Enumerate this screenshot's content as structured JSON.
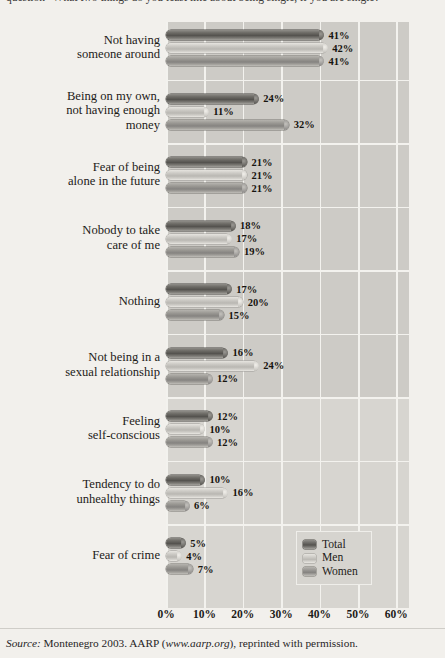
{
  "caption": "question \"What two things do you least like about being single, if you are single?\"",
  "source": {
    "prefix": "Source:",
    "text": " Montenegro 2003. AARP (",
    "url": "www.aarp.org",
    "suffix": "), reprinted with permission."
  },
  "legend": {
    "items": [
      {
        "label": "Total",
        "key": "total",
        "color": "#55534f"
      },
      {
        "label": "Men",
        "key": "men",
        "color": "#cdcbc6"
      },
      {
        "label": "Women",
        "key": "women",
        "color": "#9b9994"
      }
    ]
  },
  "axis": {
    "ticks": [
      "0%",
      "10%",
      "20%",
      "30%",
      "40%",
      "50%",
      "60%"
    ],
    "min": 0,
    "max": 60,
    "step": 10
  },
  "chart_data": {
    "type": "bar",
    "orientation": "horizontal",
    "title": "",
    "xlabel": "",
    "ylabel": "",
    "xlim": [
      0,
      60
    ],
    "grid": true,
    "legend_position": "bottom-right",
    "categories": [
      "Not having someone around",
      "Being on my own, not having enough money",
      "Fear of being alone in the future",
      "Nobody to take care of me",
      "Nothing",
      "Not being in a sexual relationship",
      "Feeling self-conscious",
      "Tendency to do unhealthy things",
      "Fear of crime"
    ],
    "category_lines": [
      [
        "Not having",
        "someone around"
      ],
      [
        "Being on my own,",
        "not having enough",
        "money"
      ],
      [
        "Fear of being",
        "alone in the future"
      ],
      [
        "Nobody to take",
        "care of me"
      ],
      [
        "Nothing"
      ],
      [
        "Not being in a",
        "sexual relationship"
      ],
      [
        "Feeling",
        "self-conscious"
      ],
      [
        "Tendency to do",
        "unhealthy things"
      ],
      [
        "Fear of crime"
      ]
    ],
    "series": [
      {
        "name": "Total",
        "key": "total",
        "values": [
          41,
          24,
          21,
          18,
          17,
          16,
          12,
          10,
          5
        ]
      },
      {
        "name": "Men",
        "key": "men",
        "values": [
          42,
          11,
          21,
          17,
          20,
          24,
          10,
          16,
          4
        ]
      },
      {
        "name": "Women",
        "key": "women",
        "values": [
          41,
          32,
          21,
          19,
          15,
          12,
          12,
          6,
          7
        ]
      }
    ],
    "labels": {
      "total": [
        "41%",
        "24%",
        "21%",
        "18%",
        "17%",
        "16%",
        "12%",
        "10%",
        "5%"
      ],
      "men": [
        "42%",
        "11%",
        "21%",
        "17%",
        "20%",
        "24%",
        "10%",
        "16%",
        "4%"
      ],
      "women": [
        "41%",
        "32%",
        "21%",
        "19%",
        "15%",
        "12%",
        "12%",
        "6%",
        "7%"
      ]
    }
  }
}
